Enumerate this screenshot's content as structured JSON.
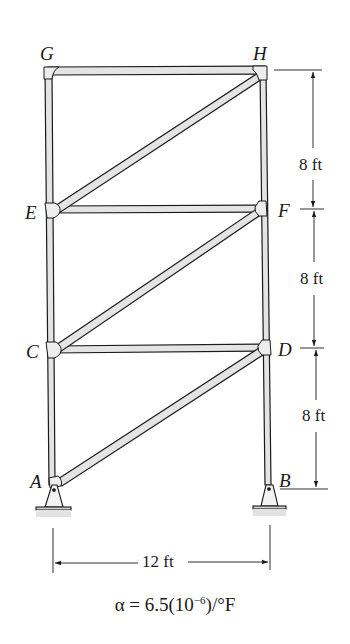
{
  "figure": {
    "type": "truss-frame",
    "joints": [
      {
        "id": "G",
        "label": "G",
        "x": 0,
        "y": 24
      },
      {
        "id": "H",
        "label": "H",
        "x": 12,
        "y": 24
      },
      {
        "id": "E",
        "label": "E",
        "x": 0,
        "y": 16
      },
      {
        "id": "F",
        "label": "F",
        "x": 12,
        "y": 16
      },
      {
        "id": "C",
        "label": "C",
        "x": 0,
        "y": 8
      },
      {
        "id": "D",
        "label": "D",
        "x": 12,
        "y": 8
      },
      {
        "id": "A",
        "label": "A",
        "x": 0,
        "y": 0
      },
      {
        "id": "B",
        "label": "B",
        "x": 12,
        "y": 0
      }
    ],
    "members": [
      "AC",
      "CE",
      "EG",
      "BD",
      "DF",
      "FH",
      "GH",
      "EF",
      "CD",
      "EH",
      "CF",
      "AD"
    ],
    "supports": [
      {
        "joint": "A",
        "type": "pin"
      },
      {
        "joint": "B",
        "type": "pin"
      }
    ],
    "dimensions": {
      "vertical": [
        "8 ft",
        "8 ft",
        "8 ft"
      ],
      "horizontal": "12 ft"
    },
    "formula": {
      "prefix": "α = 6.5(10",
      "exponent": "−6",
      "suffix": ")/°F"
    }
  }
}
